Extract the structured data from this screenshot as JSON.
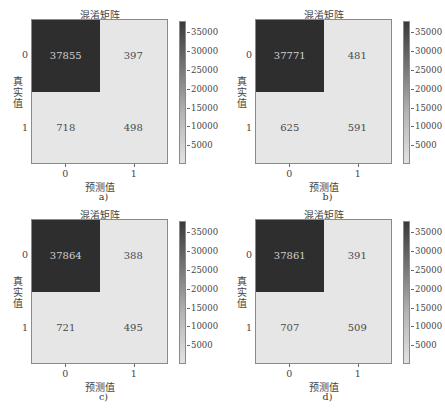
{
  "chart_data": [
    {
      "type": "heatmap",
      "panel_label": "a)",
      "title": "混淆矩阵",
      "xlabel": "预测值",
      "ylabel": "真实值",
      "x_ticks": [
        "0",
        "1"
      ],
      "y_ticks": [
        "0",
        "1"
      ],
      "matrix": [
        [
          37855,
          397
        ],
        [
          718,
          498
        ]
      ],
      "colorbar_ticks": [
        "35000",
        "30000",
        "25000",
        "20000",
        "15000",
        "10000",
        "5000"
      ],
      "colorbar_range": [
        0,
        37855
      ],
      "colormap": "greys"
    },
    {
      "type": "heatmap",
      "panel_label": "b)",
      "title": "混淆矩阵",
      "xlabel": "预测值",
      "ylabel": "真实值",
      "x_ticks": [
        "0",
        "1"
      ],
      "y_ticks": [
        "0",
        "1"
      ],
      "matrix": [
        [
          37771,
          481
        ],
        [
          625,
          591
        ]
      ],
      "colorbar_ticks": [
        "35000",
        "30000",
        "25000",
        "20000",
        "15000",
        "10000",
        "5000"
      ],
      "colorbar_range": [
        0,
        37771
      ],
      "colormap": "greys"
    },
    {
      "type": "heatmap",
      "panel_label": "c)",
      "title": "混淆矩阵",
      "xlabel": "预测值",
      "ylabel": "真实值",
      "x_ticks": [
        "0",
        "1"
      ],
      "y_ticks": [
        "0",
        "1"
      ],
      "matrix": [
        [
          37864,
          388
        ],
        [
          721,
          495
        ]
      ],
      "colorbar_ticks": [
        "35000",
        "30000",
        "25000",
        "20000",
        "15000",
        "10000",
        "5000"
      ],
      "colorbar_range": [
        0,
        37864
      ],
      "colormap": "greys"
    },
    {
      "type": "heatmap",
      "panel_label": "d)",
      "title": "混淆矩阵",
      "xlabel": "预测值",
      "ylabel": "真实值",
      "x_ticks": [
        "0",
        "1"
      ],
      "y_ticks": [
        "0",
        "1"
      ],
      "matrix": [
        [
          37861,
          391
        ],
        [
          707,
          509
        ]
      ],
      "colorbar_ticks": [
        "35000",
        "30000",
        "25000",
        "20000",
        "15000",
        "10000",
        "5000"
      ],
      "colorbar_range": [
        0,
        37861
      ],
      "colormap": "greys"
    }
  ],
  "panels": [
    {
      "label": "a)",
      "title": "混淆矩阵",
      "xlabel": "预测值",
      "ylabel": "真实值",
      "cells": [
        "37855",
        "397",
        "718",
        "498"
      ],
      "xticks": [
        "0",
        "1"
      ],
      "yticks": [
        "0",
        "1"
      ],
      "cbticks": [
        "35000",
        "30000",
        "25000",
        "20000",
        "15000",
        "10000",
        "5000"
      ]
    },
    {
      "label": "b)",
      "title": "混淆矩阵",
      "xlabel": "预测值",
      "ylabel": "真实值",
      "cells": [
        "37771",
        "481",
        "625",
        "591"
      ],
      "xticks": [
        "0",
        "1"
      ],
      "yticks": [
        "0",
        "1"
      ],
      "cbticks": [
        "35000",
        "30000",
        "25000",
        "20000",
        "15000",
        "10000",
        "5000"
      ]
    },
    {
      "label": "c)",
      "title": "混淆矩阵",
      "xlabel": "预测值",
      "ylabel": "真实值",
      "cells": [
        "37864",
        "388",
        "721",
        "495"
      ],
      "xticks": [
        "0",
        "1"
      ],
      "yticks": [
        "0",
        "1"
      ],
      "cbticks": [
        "35000",
        "30000",
        "25000",
        "20000",
        "15000",
        "10000",
        "5000"
      ]
    },
    {
      "label": "d)",
      "title": "混淆矩阵",
      "xlabel": "预测值",
      "ylabel": "真实值",
      "cells": [
        "37861",
        "391",
        "707",
        "509"
      ],
      "xticks": [
        "0",
        "1"
      ],
      "yticks": [
        "0",
        "1"
      ],
      "cbticks": [
        "35000",
        "30000",
        "25000",
        "20000",
        "15000",
        "10000",
        "5000"
      ]
    }
  ],
  "colors": {
    "dark_cell": "#2e2e2e",
    "light_cell": "#e6e6e6",
    "dark_cell_text": "#d2d2d2",
    "light_cell_text": "#4a4a4a"
  }
}
